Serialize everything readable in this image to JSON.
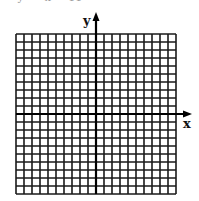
{
  "diagram": {
    "type": "coordinate-grid",
    "grid": {
      "columns": 20,
      "rows": 20,
      "left": 16,
      "top": 34,
      "cell_size": 8,
      "line_color": "#1a1a1a"
    },
    "axes": {
      "x_label": "x",
      "y_label": "y",
      "color": "#000000"
    },
    "top_fragment": "     y      x     11"
  }
}
